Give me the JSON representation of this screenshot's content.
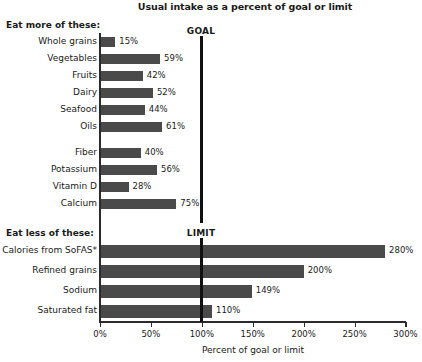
{
  "chart_data": {
    "type": "bar",
    "orientation": "horizontal",
    "title": "Usual intake as a percent of goal or limit",
    "xlabel": "Percent of goal or limit",
    "ylabel": "",
    "xlim": [
      0,
      300
    ],
    "grid": false,
    "legend": null,
    "tick_labels": [
      "0%",
      "50%",
      "100%",
      "150%",
      "200%",
      "250%",
      "300%"
    ],
    "tick_values": [
      0,
      50,
      100,
      150,
      200,
      250,
      300
    ],
    "bar_color": "#4a4a4a",
    "reference_lines": [
      {
        "label": "GOAL",
        "value": 100
      },
      {
        "label": "LIMIT",
        "value": 100
      }
    ],
    "groups": [
      {
        "header": "Eat more of these:",
        "subgroups": [
          {
            "categories": [
              "Whole grains",
              "Vegetables",
              "Fruits",
              "Dairy",
              "Seafood",
              "Oils"
            ],
            "values": [
              15,
              59,
              42,
              52,
              44,
              61
            ],
            "value_labels": [
              "15%",
              "59%",
              "42%",
              "52%",
              "44%",
              "61%"
            ]
          },
          {
            "categories": [
              "Fiber",
              "Potassium",
              "Vitamin D",
              "Calcium"
            ],
            "values": [
              40,
              56,
              28,
              75
            ],
            "value_labels": [
              "40%",
              "56%",
              "28%",
              "75%"
            ]
          }
        ]
      },
      {
        "header": "Eat less of these:",
        "subgroups": [
          {
            "categories": [
              "Calories from SoFAS*",
              "Refined grains",
              "Sodium",
              "Saturated fat"
            ],
            "values": [
              280,
              200,
              149,
              110
            ],
            "value_labels": [
              "280%",
              "200%",
              "149%",
              "110%"
            ]
          }
        ]
      }
    ],
    "categories": [
      "Whole grains",
      "Vegetables",
      "Fruits",
      "Dairy",
      "Seafood",
      "Oils",
      "Fiber",
      "Potassium",
      "Vitamin D",
      "Calcium",
      "Calories from SoFAS*",
      "Refined grains",
      "Sodium",
      "Saturated fat"
    ],
    "values": [
      15,
      59,
      42,
      52,
      44,
      61,
      40,
      56,
      28,
      75,
      280,
      200,
      149,
      110
    ]
  },
  "layout": {
    "rows_top": [
      {
        "cat": 0,
        "label_top": 36,
        "bar_top": 37,
        "bar_h": 10,
        "val_top": 36
      },
      {
        "cat": 1,
        "label_top": 53,
        "bar_top": 54,
        "bar_h": 10,
        "val_top": 53
      },
      {
        "cat": 2,
        "label_top": 70,
        "bar_top": 71,
        "bar_h": 10,
        "val_top": 70
      },
      {
        "cat": 3,
        "label_top": 87,
        "bar_top": 88,
        "bar_h": 10,
        "val_top": 87
      },
      {
        "cat": 4,
        "label_top": 104,
        "bar_top": 105,
        "bar_h": 10,
        "val_top": 104
      },
      {
        "cat": 5,
        "label_top": 121,
        "bar_top": 122,
        "bar_h": 10,
        "val_top": 121
      },
      {
        "cat": 6,
        "label_top": 147,
        "bar_top": 148,
        "bar_h": 10,
        "val_top": 147
      },
      {
        "cat": 7,
        "label_top": 164,
        "bar_top": 165,
        "bar_h": 10,
        "val_top": 164
      },
      {
        "cat": 8,
        "label_top": 181,
        "bar_top": 182,
        "bar_h": 10,
        "val_top": 181
      },
      {
        "cat": 9,
        "label_top": 198,
        "bar_top": 199,
        "bar_h": 10,
        "val_top": 198
      },
      {
        "cat": 10,
        "label_top": 245,
        "bar_top": 245,
        "bar_h": 13,
        "val_top": 245
      },
      {
        "cat": 11,
        "label_top": 265,
        "bar_top": 265,
        "bar_h": 13,
        "val_top": 265
      },
      {
        "cat": 12,
        "label_top": 285,
        "bar_top": 285,
        "bar_h": 13,
        "val_top": 285
      },
      {
        "cat": 13,
        "label_top": 305,
        "bar_top": 305,
        "bar_h": 13,
        "val_top": 305
      }
    ],
    "x0_px": 100,
    "px_per_percent": 1.0183
  }
}
